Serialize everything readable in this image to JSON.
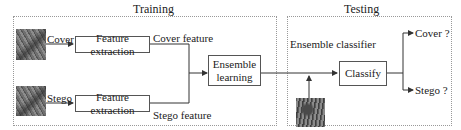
{
  "training": {
    "title": "Training",
    "cover_label": "Cover",
    "stego_label": "Stego",
    "feature_extraction_1": "Feature extraction",
    "feature_extraction_2": "Feature extraction",
    "cover_feature": "Cover feature",
    "stego_feature": "Stego feature",
    "ensemble_learning_line1": "Ensemble",
    "ensemble_learning_line2": "learning",
    "cover_image_icon": "lena-image",
    "stego_image_icon": "lena-image"
  },
  "testing": {
    "title": "Testing",
    "ensemble_classifier": "Ensemble classifier",
    "classify": "Classify",
    "output_cover": "Cover ?",
    "output_stego": "Stego ?",
    "test_image_icon": "baboon-image"
  },
  "colors": {
    "line": "#333333",
    "border": "#555555",
    "panel_border": "#999999"
  }
}
